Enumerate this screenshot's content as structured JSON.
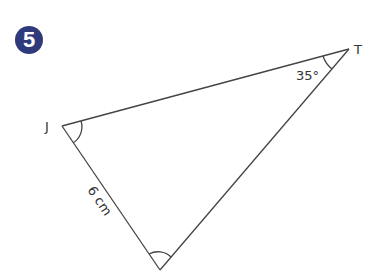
{
  "question": {
    "number": "5",
    "badge_color": "#2f3a7a"
  },
  "triangle": {
    "vertices": [
      {
        "name": "J",
        "label": "J"
      },
      {
        "name": "T",
        "label": "T"
      },
      {
        "name": "bottom",
        "label": ""
      }
    ],
    "angle_T": "35°",
    "side_J_bottom": "6 cm",
    "marked_angles": [
      "J",
      "bottom"
    ]
  }
}
